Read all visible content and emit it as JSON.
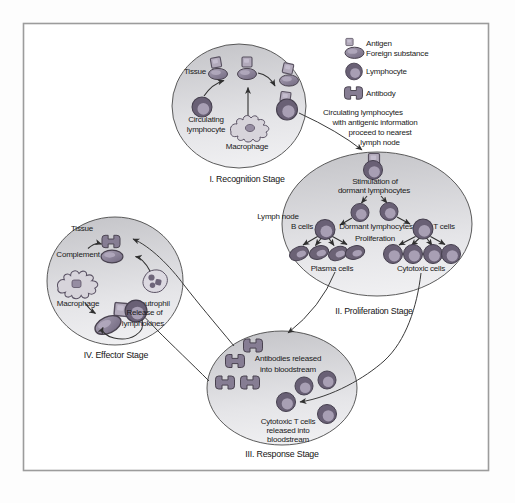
{
  "figure": {
    "legend": {
      "items": [
        {
          "label": "Antigen"
        },
        {
          "label": "Foreign substance"
        },
        {
          "label": "Lymphocyte"
        },
        {
          "label": "Antibody"
        }
      ]
    },
    "annotation": {
      "line1": "Circulating lymphocytes",
      "line2": "with antigenic information",
      "line3": "proceed to nearest",
      "line4": "lymph node"
    },
    "recognition": {
      "caption": "I. Recognition Stage",
      "tissue_label": "Tissue",
      "circulating_line1": "Circulating",
      "circulating_line2": "lymphocyte",
      "macrophage_label": "Macrophage"
    },
    "proliferation": {
      "caption": "II. Proliferation Stage",
      "lymph_node_label": "Lymph node",
      "stimulation_line1": "Stimulation of",
      "stimulation_line2": "dormant lymphocytes",
      "b_cells_label": "B cells",
      "dormant_label": "Dormant lymphocytes",
      "t_cells_label": "T cells",
      "proliferation_label": "Proliferation",
      "plasma_label": "Plasma cells",
      "cytotoxic_label": "Cytotoxic cells"
    },
    "response": {
      "caption": "III. Response Stage",
      "antibodies_line1": "Antibodies released",
      "antibodies_line2": "into bloodstream",
      "cytotoxic_line1": "Cytotoxic T cells",
      "cytotoxic_line2": "released into",
      "cytotoxic_line3": "bloodstream"
    },
    "effector": {
      "caption": "IV. Effector Stage",
      "tissue_label": "Tissue",
      "complement_label": "Complement",
      "macrophage_label": "Macrophage",
      "neutrophil_label": "Neutrophil",
      "release_line1": "Release of",
      "release_line2": "lymphokines"
    },
    "colors": {
      "cell_dark_outline": "#49424f",
      "cell_ring": "#696075",
      "cell_inner": "#a89fb4",
      "cell_mid": "#867d93",
      "antigen_fill": "#b2aabb",
      "stage_fill_top": "#c6c6ca",
      "stage_fill_bottom": "#f0f0f2",
      "line": "#3a3a3a",
      "text": "#1a1a1a",
      "frame": "#9c9c9c"
    }
  }
}
